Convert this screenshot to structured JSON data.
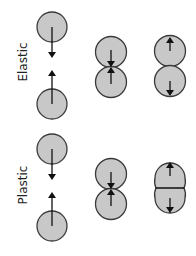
{
  "diagram": {
    "type": "collision-comparison",
    "rows": [
      {
        "label": "Elastic",
        "stages": [
          "approach",
          "contact",
          "rebound-separate"
        ]
      },
      {
        "label": "Plastic",
        "stages": [
          "approach",
          "contact",
          "merged-deformed"
        ]
      }
    ],
    "colors": {
      "ball_fill": "#c8c8c8",
      "ball_stroke": "#3a3a3a",
      "arrow": "#111111",
      "label": "#222222"
    }
  }
}
